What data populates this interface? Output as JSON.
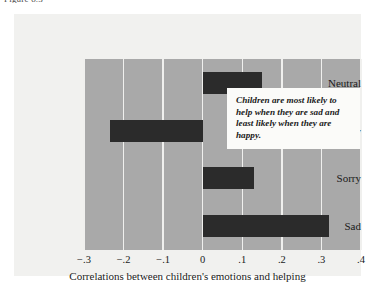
{
  "figure": {
    "caption": "Figure 8.3"
  },
  "annotation": {
    "text": "Children are most likely to help when they are sad and least likely when they are happy."
  },
  "colors": {
    "plot_background": "#a9a9a9",
    "card_background": "#f1f1ef",
    "bar_fill": "#2b2b2b",
    "gridline": "#f0f0ee",
    "annotation_background": "#fbfbf9",
    "text": "#1a1a1a"
  },
  "chart_data": {
    "type": "bar",
    "orientation": "horizontal",
    "title": "",
    "subtitle": "",
    "categories": [
      "Neutral",
      "Happy",
      "Sorry",
      "Sad"
    ],
    "values": [
      0.15,
      -0.235,
      0.13,
      0.32
    ],
    "series": [
      {
        "name": "Correlations between children's emotions and helping",
        "values": [
          0.15,
          -0.235,
          0.13,
          0.32
        ]
      }
    ],
    "xlabel": "Correlations between children's emotions and helping",
    "ylabel": "",
    "xlim": [
      -0.3,
      0.4
    ],
    "ylim": null,
    "xticks": [
      -0.3,
      -0.2,
      -0.1,
      0,
      0.1,
      0.2,
      0.3,
      0.4
    ],
    "xticklabels": [
      "−.3",
      "−.2",
      "−.1",
      "0",
      ".1",
      ".2",
      ".3",
      ".4"
    ],
    "grid": true,
    "grid_axis": "x",
    "legend": false,
    "legend_position": "none",
    "annotations": [
      "Children are most likely to help when they are sad and least likely when they are happy."
    ]
  }
}
